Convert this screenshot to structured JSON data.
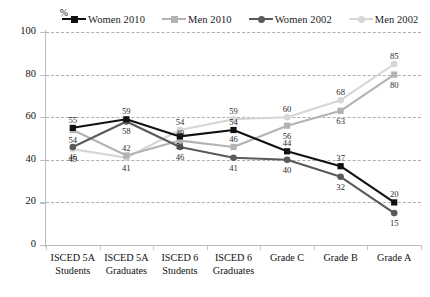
{
  "chart_data": {
    "type": "line",
    "title": "",
    "xlabel": "",
    "ylabel": "%",
    "ylim": [
      0,
      100
    ],
    "ytick_values": [
      0,
      20,
      40,
      60,
      80,
      100
    ],
    "grid": true,
    "legend_position": "top",
    "categories": [
      "ISCED 5A Students",
      "ISCED 5A Graduates",
      "ISCED 6 Students",
      "ISCED 6 Graduates",
      "Grade C",
      "Grade B",
      "Grade A"
    ],
    "category_lines": [
      [
        "ISCED 5A",
        "Students"
      ],
      [
        "ISCED 5A",
        "Graduates"
      ],
      [
        "ISCED 6",
        "Students"
      ],
      [
        "ISCED 6",
        "Graduates"
      ],
      [
        "Grade C",
        ""
      ],
      [
        "Grade B",
        ""
      ],
      [
        "Grade A",
        ""
      ]
    ],
    "series": [
      {
        "name": "Women 2010",
        "color": "#111111",
        "marker": "square",
        "values": [
          55,
          59,
          51,
          54,
          44,
          37,
          20
        ],
        "label_offsets": [
          "above",
          "above",
          "below",
          "above",
          "above",
          "above",
          "above"
        ]
      },
      {
        "name": "Men 2010",
        "color": "#b3b3b3",
        "marker": "square",
        "values": [
          54,
          42,
          49,
          46,
          56,
          63,
          80
        ],
        "label_offsets": [
          "below",
          "above",
          "above",
          "above",
          "below",
          "below",
          "below"
        ]
      },
      {
        "name": "Women 2002",
        "color": "#5a5a5a",
        "marker": "circle",
        "values": [
          46,
          58,
          46,
          41,
          40,
          32,
          15
        ],
        "label_offsets": [
          "below",
          "below",
          "below",
          "below",
          "below",
          "below",
          "below"
        ]
      },
      {
        "name": "Men 2002",
        "color": "#d6d6d6",
        "marker": "circle",
        "values": [
          45,
          41,
          54,
          59,
          60,
          68,
          85
        ],
        "label_offsets": [
          "below",
          "below",
          "above",
          "above",
          "above",
          "above",
          "above"
        ]
      }
    ]
  },
  "axis": {
    "y_unit": "%",
    "y_ticks": [
      "0",
      "20",
      "40",
      "60",
      "80",
      "100"
    ]
  },
  "legend": {
    "items": [
      {
        "label": "Women 2010",
        "color": "#111111",
        "marker": "square"
      },
      {
        "label": "Men 2010",
        "color": "#b3b3b3",
        "marker": "square"
      },
      {
        "label": "Women 2002",
        "color": "#5a5a5a",
        "marker": "circle"
      },
      {
        "label": "Men 2002",
        "color": "#d6d6d6",
        "marker": "circle"
      }
    ]
  }
}
